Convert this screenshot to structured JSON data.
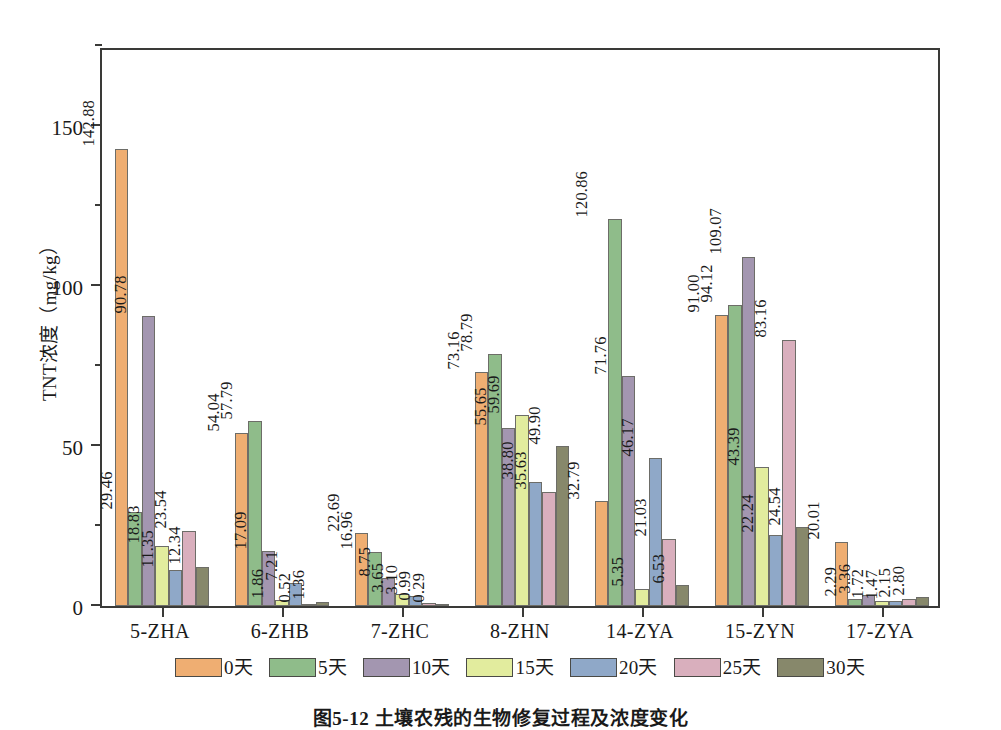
{
  "chart_data": {
    "type": "bar",
    "title": "",
    "xlabel": "",
    "ylabel": "TNT浓度（mg/kg）",
    "ylim": [
      0,
      175
    ],
    "yticks": [
      0,
      50,
      100,
      150
    ],
    "yticklabels": [
      "0",
      "50",
      "100",
      "150"
    ],
    "yminorticks": [
      25,
      75,
      125,
      175
    ],
    "grid": false,
    "legend_position": "bottom",
    "categories": [
      "5-ZHA",
      "6-ZHB",
      "7-ZHC",
      "8-ZHN",
      "14-ZYA",
      "15-ZYN",
      "17-ZYA"
    ],
    "series": [
      {
        "name": "0天",
        "color": "#EFAE72",
        "values": [
          142.88,
          54.04,
          22.69,
          73.16,
          32.79,
          91.0,
          20.01
        ],
        "labels": [
          "142.88",
          "54.04",
          "22.69",
          "73.16",
          "32.79",
          "91.00",
          "20.01"
        ]
      },
      {
        "name": "5天",
        "color": "#8FBC8A",
        "values": [
          29.46,
          57.79,
          16.96,
          78.79,
          120.86,
          94.12,
          2.29
        ],
        "labels": [
          "29.46",
          "57.79",
          "16.96",
          "78.79",
          "120.86",
          "94.12",
          "2.29"
        ]
      },
      {
        "name": "10天",
        "color": "#A396B0",
        "values": [
          90.78,
          17.09,
          8.75,
          55.65,
          71.76,
          109.07,
          3.36
        ],
        "labels": [
          "90.78",
          "17.09",
          "8.75",
          "55.65",
          "71.76",
          "109.07",
          "3.36"
        ]
      },
      {
        "name": "15天",
        "color": "#E2EC9E",
        "values": [
          18.83,
          1.86,
          3.65,
          59.69,
          5.35,
          43.39,
          1.72
        ],
        "labels": [
          "18.83",
          "1.86",
          "3.65",
          "59.69",
          "5.35",
          "43.39",
          "1.72"
        ]
      },
      {
        "name": "20天",
        "color": "#8FA8C8",
        "values": [
          11.35,
          7.21,
          3.1,
          38.8,
          46.17,
          22.24,
          1.47
        ],
        "labels": [
          "11.35",
          "7.21",
          "3.10",
          "38.80",
          "46.17",
          "22.24",
          "1.47"
        ]
      },
      {
        "name": "25天",
        "color": "#D9AFBD",
        "values": [
          23.54,
          0.52,
          0.99,
          35.63,
          21.03,
          83.16,
          2.15
        ],
        "labels": [
          "23.54",
          "0.52",
          "0.99",
          "35.63",
          "21.03",
          "83.16",
          "2.15"
        ]
      },
      {
        "name": "30天",
        "color": "#87886B",
        "values": [
          12.34,
          1.36,
          0.29,
          49.9,
          6.53,
          24.54,
          2.8
        ],
        "labels": [
          "12.34",
          "1.36",
          "0.29",
          "49.90",
          "6.53",
          "24.54",
          "2.80"
        ]
      }
    ]
  },
  "axis": {
    "y_title": "TNT浓度（mg/kg）"
  },
  "caption": {
    "text": "图5-12  土壤农残的生物修复过程及浓度变化"
  }
}
